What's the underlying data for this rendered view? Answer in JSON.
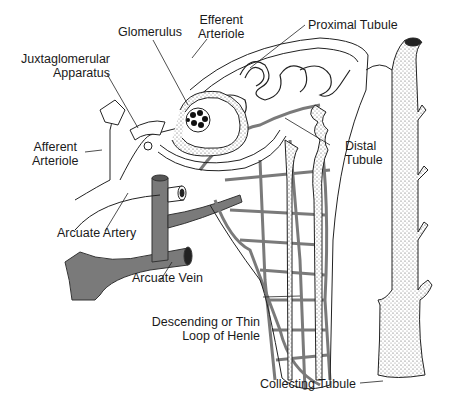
{
  "diagram": {
    "colors": {
      "ink": "#1a1a1a",
      "vessel": "#7a7a7a",
      "background": "#ffffff",
      "stipple": "#5a5a5a"
    },
    "labels": {
      "glomerulus": {
        "text": "Glomerulus"
      },
      "efferent": {
        "line1": "Efferent",
        "line2": "Arteriole"
      },
      "proximal": {
        "text": "Proximal Tubule"
      },
      "juxta": {
        "line1": "Juxtaglomerular",
        "line2": "Apparatus"
      },
      "afferent": {
        "line1": "Afferent",
        "line2": "Arteriole"
      },
      "distal": {
        "line1": "Distal",
        "line2": "Tubule"
      },
      "arcuate_artery": {
        "text": "Arcuate Artery"
      },
      "arcuate_vein": {
        "text": "Arcuate Vein"
      },
      "loop": {
        "line1": "Descending or Thin",
        "line2": "Loop of Henle"
      },
      "collecting": {
        "text": "Collecting Tubule"
      }
    }
  }
}
